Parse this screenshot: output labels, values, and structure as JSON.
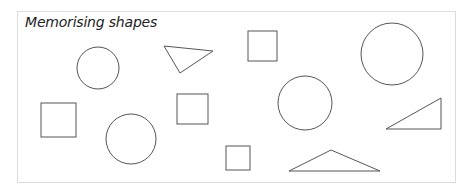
{
  "title": "Memorising shapes",
  "stroke_color": "#555555",
  "border_color": "#dcdcdc",
  "shapes": [
    {
      "type": "circle",
      "cx": 98,
      "cy": 68,
      "r": 21
    },
    {
      "type": "triangle",
      "points": "164,46 213,51 180,73"
    },
    {
      "type": "square",
      "x": 248,
      "y": 31,
      "w": 29,
      "h": 30
    },
    {
      "type": "circle",
      "cx": 392,
      "cy": 54,
      "r": 31
    },
    {
      "type": "square",
      "x": 41,
      "y": 103,
      "w": 35,
      "h": 34
    },
    {
      "type": "circle",
      "cx": 131,
      "cy": 139,
      "r": 25
    },
    {
      "type": "square",
      "x": 177,
      "y": 94,
      "w": 31,
      "h": 30
    },
    {
      "type": "circle",
      "cx": 305,
      "cy": 103,
      "r": 27
    },
    {
      "type": "triangle",
      "points": "386,129 441,98 441,129"
    },
    {
      "type": "square",
      "x": 226,
      "y": 146,
      "w": 24,
      "h": 24
    },
    {
      "type": "triangle",
      "points": "289,171 331,150 380,171"
    }
  ]
}
